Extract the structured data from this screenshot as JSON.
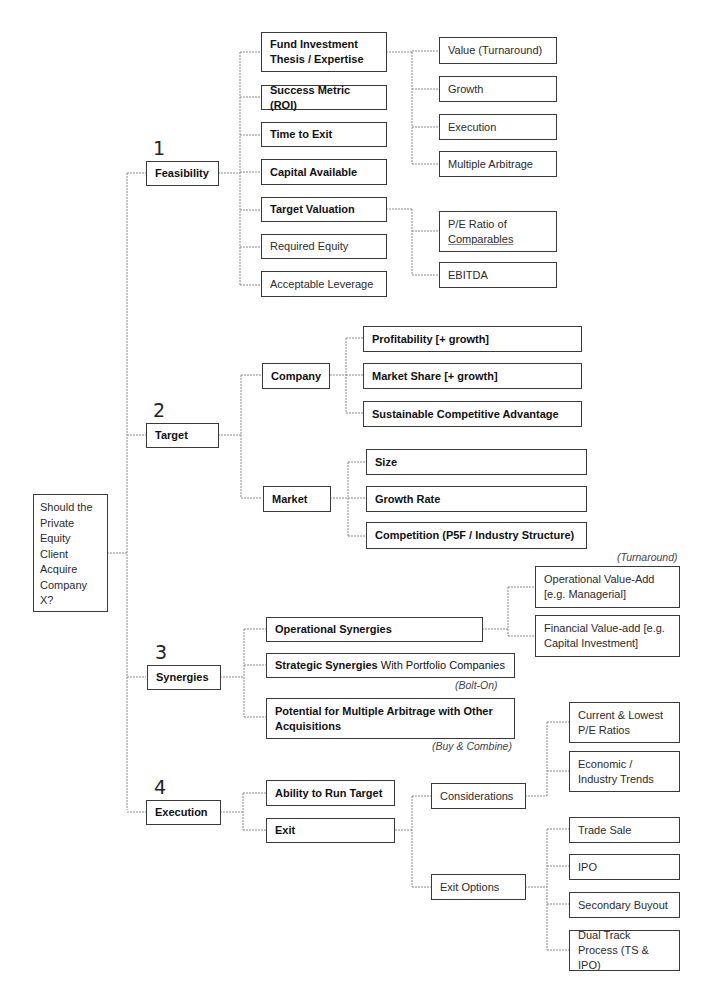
{
  "root": {
    "label": "Should the Private Equity Client Acquire Company X?"
  },
  "branches": [
    {
      "number": "1",
      "label": "Feasibility",
      "children": [
        {
          "label": "Fund Investment Thesis / Expertise",
          "children": [
            "Value (Turnaround)",
            "Growth",
            "Execution",
            "Multiple Arbitrage"
          ]
        },
        {
          "label": "Success Metric (ROI)"
        },
        {
          "label": "Time to Exit"
        },
        {
          "label": "Capital Available"
        },
        {
          "label": "Target Valuation",
          "children": [
            {
              "line1": "P/E Ratio of",
              "line2": "Comparables"
            },
            "EBITDA"
          ]
        },
        {
          "label": "Required Equity"
        },
        {
          "label": "Acceptable Leverage"
        }
      ]
    },
    {
      "number": "2",
      "label": "Target",
      "children": [
        {
          "label": "Company",
          "children": [
            "Profitability [+ growth]",
            "Market Share [+ growth]",
            "Sustainable Competitive Advantage"
          ]
        },
        {
          "label": "Market",
          "children": [
            "Size",
            "Growth Rate",
            "Competition (P5F / Industry Structure)"
          ]
        }
      ]
    },
    {
      "number": "3",
      "label": "Synergies",
      "children": [
        {
          "label": "Operational Synergies",
          "note": "(Turnaround)",
          "children": [
            "Operational Value-Add [e.g. Managerial]",
            "Financial Value-add [e.g. Capital Investment]"
          ]
        },
        {
          "label_bold": "Strategic Synergies",
          "label_rest": " With Portfolio Companies",
          "note": "(Bolt-On)"
        },
        {
          "label": "Potential for Multiple Arbitrage with Other Acquisitions",
          "note": "(Buy & Combine)"
        }
      ]
    },
    {
      "number": "4",
      "label": "Execution",
      "children": [
        {
          "label": "Ability to Run Target"
        },
        {
          "label": "Exit",
          "children": [
            {
              "label": "Considerations",
              "children": [
                "Current & Lowest P/E Ratios",
                "Economic / Industry Trends"
              ]
            },
            {
              "label": "Exit Options",
              "children": [
                "Trade Sale",
                "IPO",
                "Secondary Buyout",
                "Dual Track Process (TS & IPO)"
              ]
            }
          ]
        }
      ]
    }
  ]
}
